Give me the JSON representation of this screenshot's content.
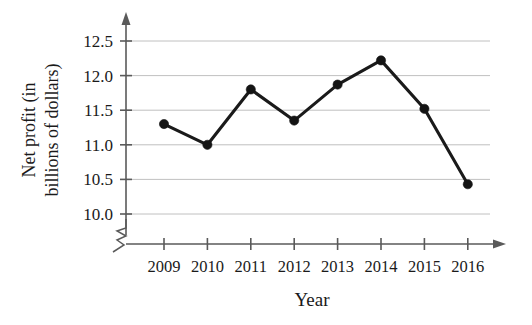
{
  "chart_data": {
    "type": "line",
    "title": "",
    "xlabel": "Year",
    "ylabel": "Net profit (in billions of dollars)",
    "ylabel_line1": "Net profit (in",
    "ylabel_line2": "billions of dollars)",
    "categories": [
      "2009",
      "2010",
      "2011",
      "2012",
      "2013",
      "2014",
      "2015",
      "2016"
    ],
    "values": [
      11.3,
      11.0,
      11.8,
      11.35,
      11.87,
      12.22,
      11.52,
      10.43
    ],
    "series": [
      {
        "name": "Net profit",
        "values": [
          11.3,
          11.0,
          11.8,
          11.35,
          11.87,
          12.22,
          11.52,
          10.43
        ]
      }
    ],
    "ylim": [
      10.0,
      12.5
    ],
    "ytick_labels": [
      "10.0",
      "10.5",
      "11.0",
      "11.5",
      "12.0",
      "12.5"
    ],
    "ytick_values": [
      10.0,
      10.5,
      11.0,
      11.5,
      12.0,
      12.5
    ],
    "xtick_labels": [
      "2009",
      "2010",
      "2011",
      "2012",
      "2013",
      "2014",
      "2015",
      "2016"
    ],
    "grid": "horizontal",
    "legend": "none",
    "y_axis_broken": true,
    "line_color": "#141414",
    "marker_color": "#141414",
    "grid_color": "#b9b9b9",
    "axis_color": "#5a5a5a"
  }
}
